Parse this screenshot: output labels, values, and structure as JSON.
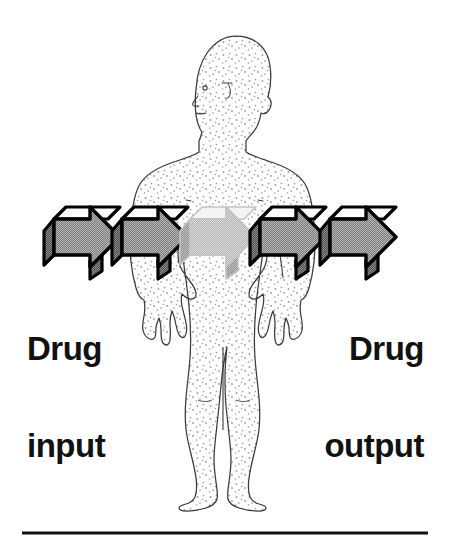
{
  "page": {
    "width": 468,
    "height": 549,
    "background_color": "#ffffff",
    "type": "pharmacokinetics-schematic-illustration"
  },
  "labels": {
    "input": {
      "line1": "Drug",
      "line2": "input",
      "full_text": "Drug input",
      "color": "#111111",
      "align": "left"
    },
    "output": {
      "line1": "Drug",
      "line2": "output",
      "full_text": "Drug output",
      "color": "#111111",
      "align": "right"
    }
  },
  "figure": {
    "name": "human-body-silhouette",
    "pose": "standing front view, head turned to left profile",
    "outline_color": "#3a3a3a",
    "fill_color": "#ffffff",
    "texture": "stipple-dots",
    "stipple_color": "#9a9aa0"
  },
  "arrow_chain": {
    "name": "drug-flow-arrows",
    "count": 5,
    "direction": "left-to-right",
    "style": "3d-block-arrow",
    "front_face_color": "#9d9d9d",
    "top_bevel_color": "#f2f2f2",
    "shadow_face_color": "#6e6e6e",
    "outline_color": "#000000",
    "faded_outline_color": "#b9b9b9",
    "faded_front_color": "#c7c7c7",
    "faded_top_color": "#ebebeb",
    "faded_shadow_color": "#a8a8a8",
    "arrows": [
      {
        "index": 1,
        "x": 44,
        "faded": false,
        "region": "outside-body-left"
      },
      {
        "index": 2,
        "x": 112,
        "faded": false,
        "region": "entering-body"
      },
      {
        "index": 3,
        "x": 180,
        "faded": true,
        "region": "inside-body-torso"
      },
      {
        "index": 4,
        "x": 250,
        "faded": false,
        "region": "exiting-body"
      },
      {
        "index": 5,
        "x": 320,
        "faded": false,
        "region": "outside-body-right"
      }
    ]
  },
  "rule": {
    "name": "bottom-divider-rule",
    "x_start": 22,
    "x_end": 428,
    "y": 533,
    "color": "#101010",
    "thickness": 3
  }
}
